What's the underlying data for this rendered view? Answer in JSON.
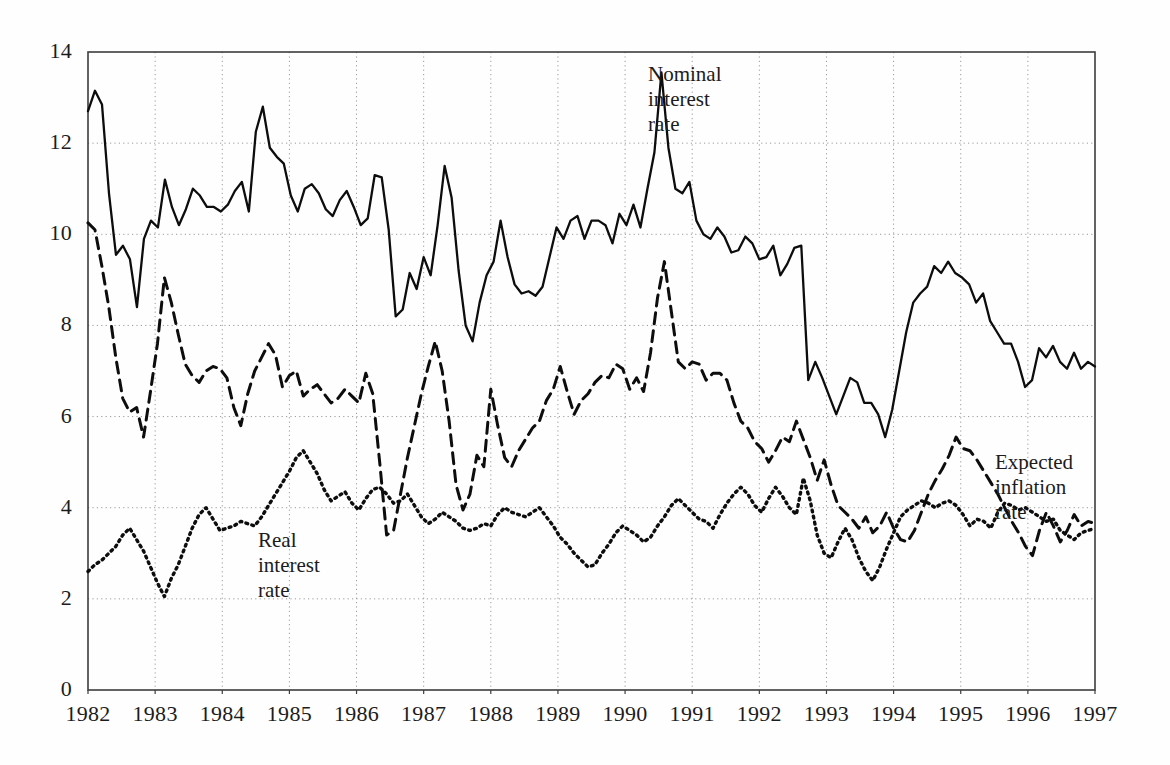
{
  "chart_data": {
    "type": "line",
    "title": "",
    "subtitle": "",
    "xlabel": "",
    "ylabel": "",
    "xlim": [
      1982.0,
      1997.0
    ],
    "ylim": [
      0,
      14
    ],
    "yticks": [
      0,
      2,
      4,
      6,
      8,
      10,
      12,
      14
    ],
    "xticks": [
      1982,
      1983,
      1984,
      1985,
      1986,
      1987,
      1988,
      1989,
      1990,
      1991,
      1992,
      1993,
      1994,
      1995,
      1996,
      1997
    ],
    "grid": true,
    "grid_style": "dotted",
    "legend_position": "inline-annotations",
    "annotations": [
      {
        "text": "Nominal\ninterest\nrate",
        "series": "nominal_interest_rate",
        "x": 1990.05,
        "y": 13.6
      },
      {
        "text": "Real\ninterest\nrate",
        "series": "real_interest_rate",
        "x": 1984.45,
        "y": 3.6
      },
      {
        "text": "Expected\ninflation\nrate",
        "series": "expected_inflation_rate",
        "x": 1995.55,
        "y": 5.9
      }
    ],
    "x_start": 1982.0,
    "x_step": 0.1111,
    "series": [
      {
        "name": "Nominal interest rate",
        "key": "nominal_interest_rate",
        "style": "solid",
        "color": "#0d0d0d",
        "values": [
          12.7,
          13.15,
          12.85,
          10.9,
          9.55,
          9.75,
          9.45,
          8.4,
          9.9,
          10.3,
          10.15,
          11.2,
          10.6,
          10.2,
          10.55,
          11.0,
          10.85,
          10.6,
          10.6,
          10.5,
          10.65,
          10.95,
          11.15,
          10.5,
          12.25,
          12.8,
          11.9,
          11.7,
          11.55,
          10.85,
          10.5,
          11.0,
          11.1,
          10.9,
          10.55,
          10.4,
          10.75,
          10.95,
          10.6,
          10.2,
          10.35,
          11.3,
          11.25,
          10.1,
          8.2,
          8.35,
          9.15,
          8.8,
          9.5,
          9.1,
          10.2,
          11.5,
          10.8,
          9.2,
          8.0,
          7.65,
          8.5,
          9.1,
          9.4,
          10.3,
          9.5,
          8.9,
          8.7,
          8.75,
          8.65,
          8.85,
          9.5,
          10.15,
          9.9,
          10.3,
          10.4,
          9.9,
          10.3,
          10.3,
          10.2,
          9.8,
          10.45,
          10.2,
          10.65,
          10.15,
          11.0,
          11.8,
          13.55,
          11.9,
          11.0,
          10.9,
          11.15,
          10.3,
          10.0,
          9.9,
          10.15,
          9.95,
          9.6,
          9.65,
          9.95,
          9.8,
          9.45,
          9.5,
          9.75,
          9.1,
          9.35,
          9.7,
          9.75,
          6.8,
          7.2,
          6.85,
          6.45,
          6.05,
          6.45,
          6.85,
          6.75,
          6.3,
          6.3,
          6.05,
          5.55,
          6.15,
          7.0,
          7.85,
          8.5,
          8.7,
          8.85,
          9.3,
          9.15,
          9.4,
          9.15,
          9.05,
          8.9,
          8.5,
          8.7,
          8.1,
          7.85,
          7.6,
          7.6,
          7.2,
          6.65,
          6.8,
          7.5,
          7.3,
          7.55,
          7.2,
          7.05,
          7.4,
          7.05,
          7.2,
          7.1
        ]
      },
      {
        "name": "Expected inflation rate",
        "key": "expected_inflation_rate",
        "style": "dashed",
        "color": "#0d0d0d",
        "values": [
          10.25,
          10.1,
          9.3,
          8.4,
          7.3,
          6.4,
          6.1,
          6.2,
          5.55,
          6.55,
          7.6,
          9.05,
          8.5,
          7.8,
          7.15,
          6.9,
          6.75,
          7.0,
          7.1,
          7.05,
          6.85,
          6.2,
          5.8,
          6.5,
          7.0,
          7.3,
          7.6,
          7.35,
          6.65,
          6.9,
          7.0,
          6.45,
          6.6,
          6.7,
          6.5,
          6.3,
          6.4,
          6.6,
          6.45,
          6.3,
          6.95,
          6.5,
          5.0,
          3.4,
          3.5,
          4.3,
          5.1,
          5.8,
          6.5,
          7.1,
          7.65,
          7.0,
          5.9,
          4.5,
          3.95,
          4.3,
          5.15,
          4.9,
          6.6,
          5.8,
          5.1,
          4.9,
          5.25,
          5.5,
          5.75,
          5.9,
          6.35,
          6.6,
          7.1,
          6.55,
          6.05,
          6.35,
          6.5,
          6.75,
          6.9,
          6.85,
          7.15,
          7.05,
          6.6,
          6.85,
          6.55,
          7.4,
          8.6,
          9.4,
          8.3,
          7.2,
          7.05,
          7.2,
          7.15,
          6.8,
          6.95,
          6.95,
          6.8,
          6.3,
          5.9,
          5.75,
          5.45,
          5.3,
          5.0,
          5.25,
          5.55,
          5.45,
          5.9,
          5.5,
          5.1,
          4.6,
          5.05,
          4.5,
          4.05,
          3.9,
          3.75,
          3.55,
          3.8,
          3.45,
          3.6,
          3.9,
          3.55,
          3.3,
          3.25,
          3.5,
          3.9,
          4.3,
          4.6,
          4.85,
          5.15,
          5.55,
          5.3,
          5.25,
          5.05,
          4.8,
          4.55,
          4.3,
          4.0,
          3.7,
          3.45,
          3.15,
          2.95,
          3.5,
          3.9,
          3.6,
          3.25,
          3.5,
          3.85,
          3.6,
          3.7,
          3.65
        ]
      },
      {
        "name": "Real interest rate",
        "key": "real_interest_rate",
        "style": "dotted",
        "color": "#0d0d0d",
        "values": [
          2.6,
          2.75,
          2.85,
          3.0,
          3.15,
          3.4,
          3.55,
          3.3,
          3.05,
          2.7,
          2.35,
          2.05,
          2.45,
          2.75,
          3.15,
          3.55,
          3.85,
          4.0,
          3.75,
          3.5,
          3.55,
          3.6,
          3.7,
          3.65,
          3.6,
          3.8,
          4.05,
          4.3,
          4.55,
          4.8,
          5.1,
          5.25,
          5.0,
          4.75,
          4.4,
          4.15,
          4.25,
          4.35,
          4.1,
          3.95,
          4.2,
          4.4,
          4.45,
          4.3,
          4.1,
          4.15,
          4.3,
          4.05,
          3.8,
          3.65,
          3.75,
          3.9,
          3.8,
          3.7,
          3.55,
          3.5,
          3.55,
          3.65,
          3.6,
          3.85,
          4.0,
          3.9,
          3.85,
          3.8,
          3.9,
          4.0,
          3.8,
          3.6,
          3.35,
          3.2,
          3.0,
          2.85,
          2.7,
          2.75,
          3.0,
          3.2,
          3.45,
          3.6,
          3.5,
          3.4,
          3.25,
          3.35,
          3.6,
          3.8,
          4.05,
          4.2,
          4.05,
          3.9,
          3.75,
          3.7,
          3.55,
          3.85,
          4.1,
          4.3,
          4.45,
          4.3,
          4.05,
          3.9,
          4.2,
          4.45,
          4.25,
          4.0,
          3.85,
          4.65,
          4.15,
          3.4,
          3.0,
          2.9,
          3.25,
          3.55,
          3.3,
          2.9,
          2.6,
          2.4,
          2.7,
          3.1,
          3.45,
          3.8,
          3.95,
          4.05,
          4.15,
          4.1,
          4.0,
          4.1,
          4.15,
          4.05,
          3.85,
          3.6,
          3.75,
          3.7,
          3.55,
          3.9,
          4.1,
          4.05,
          3.95,
          4.0,
          3.9,
          3.8,
          3.7,
          3.75,
          3.5,
          3.4,
          3.3,
          3.45,
          3.5,
          3.55
        ]
      }
    ]
  },
  "axes": {
    "y_tick_labels": [
      "14",
      "12",
      "10",
      "8",
      "6",
      "4",
      "2",
      "0"
    ],
    "x_tick_labels": [
      "1982",
      "1983",
      "1984",
      "1985",
      "1986",
      "1987",
      "1988",
      "1989",
      "1990",
      "1991",
      "1992",
      "1993",
      "1994",
      "1995",
      "1996",
      "1997"
    ]
  },
  "labels": {
    "nominal": "Nominal\ninterest\nrate",
    "real": "Real\ninterest\nrate",
    "expected": "Expected\ninflation\nrate"
  },
  "colors": {
    "line": "#0d0d0d",
    "grid": "#9a9a9a",
    "axis": "#3d3d3d",
    "background": "#fefefe",
    "text": "#1c1c1c"
  }
}
